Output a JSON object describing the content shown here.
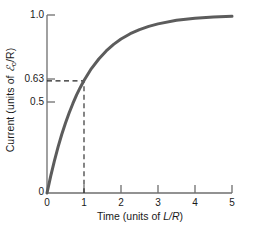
{
  "chart_data": {
    "type": "line",
    "title": "",
    "subtitle": "",
    "xlabel": "Time (units of L/R)",
    "ylabel": "Current (units of ℰ₀/R)",
    "xlim": [
      0,
      5
    ],
    "ylim": [
      0,
      1.0
    ],
    "grid": false,
    "legend": null,
    "x_ticks": [
      "0",
      "1",
      "2",
      "3",
      "4",
      "5"
    ],
    "x_tick_values": [
      0,
      1,
      2,
      3,
      4,
      5
    ],
    "y_ticks": [
      "0",
      "0.5",
      "0.63",
      "1.0"
    ],
    "y_tick_values": [
      0,
      0.5,
      0.63,
      1.0
    ],
    "series": [
      {
        "name": "i = 1 - e^(-t)",
        "color": "#5c5c5c",
        "line_width": 3,
        "x": [
          0,
          0.1,
          0.2,
          0.3,
          0.4,
          0.5,
          0.6,
          0.7,
          0.8,
          0.9,
          1.0,
          1.2,
          1.4,
          1.6,
          1.8,
          2.0,
          2.25,
          2.5,
          2.75,
          3.0,
          3.5,
          4.0,
          4.5,
          5.0
        ],
        "y": [
          0,
          0.095,
          0.181,
          0.259,
          0.33,
          0.393,
          0.451,
          0.503,
          0.551,
          0.593,
          0.632,
          0.699,
          0.753,
          0.798,
          0.835,
          0.865,
          0.895,
          0.918,
          0.936,
          0.95,
          0.97,
          0.982,
          0.989,
          0.993
        ]
      }
    ],
    "annotations": [
      {
        "name": "time-constant-guide",
        "style": "dashed",
        "color": "#222222",
        "from": {
          "x": 0,
          "y": 0.63
        },
        "corner": {
          "x": 1,
          "y": 0.63
        },
        "to": {
          "x": 1,
          "y": 0
        },
        "label": "0.63"
      }
    ]
  },
  "axis": {
    "y_label": "Current (units of ",
    "y_label_script": "ℰ",
    "y_label_sub": "o",
    "y_label_tail": "/R)",
    "x_label_lead": "Time (units of ",
    "x_label_italic": "L/R",
    "x_label_tail": ")"
  },
  "ticks": {
    "y": [
      {
        "value": 1.0,
        "label": "1.0"
      },
      {
        "value": 0.63,
        "label": "0.63"
      },
      {
        "value": 0.5,
        "label": "0.5"
      },
      {
        "value": 0.0,
        "label": "0"
      }
    ],
    "x": [
      {
        "value": 0,
        "label": "0"
      },
      {
        "value": 1,
        "label": "1"
      },
      {
        "value": 2,
        "label": "2"
      },
      {
        "value": 3,
        "label": "3"
      },
      {
        "value": 4,
        "label": "4"
      },
      {
        "value": 5,
        "label": "5"
      }
    ]
  },
  "colors": {
    "curve": "#5c5c5c",
    "axis": "#6e6e6e",
    "dash": "#222222",
    "text": "#1a1a1a",
    "background": "#ffffff"
  }
}
